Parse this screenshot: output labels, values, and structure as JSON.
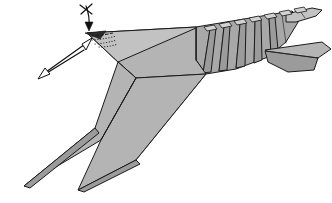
{
  "figure": {
    "background_color": "#ffffff",
    "width": 332,
    "height": 203,
    "caption": ""
  },
  "palette": {
    "paper_front": "#b4b4b4",
    "paper_mid": "#a8a8a8",
    "paper_shade": "#9b9b9b",
    "paper_light": "#c2c2c2",
    "paper_dark": "#2b2b2b",
    "loop_tab": "#d2d2d2",
    "line": "#1a1a1a",
    "arrow": "#111111"
  },
  "parts": {
    "head_tip": "head-tip",
    "head_plate": "head-plate",
    "body_panel": "body-panel",
    "upper_wing": "upper-wing",
    "lower_wing": "lower-wing",
    "wing_underside": "wing-underside",
    "abdomen": "segmented-abdomen",
    "tail_fin_upper": "tail-fin-upper",
    "tail_fin_lower": "tail-fin-lower",
    "antenna_tip": "antenna-tip"
  },
  "segments": {
    "label": "abdomen-segments",
    "count": 6
  },
  "loop_tabs": {
    "label": "spine-tabs",
    "count": 7
  },
  "annotations": {
    "fold_arrow": {
      "name": "valley-fold-arrow",
      "kind": "fold-down-arrow",
      "direction": "down"
    },
    "unfold_marker": {
      "name": "fold-and-unfold-tick",
      "kind": "crossing-tick"
    },
    "pleat_arrow": {
      "name": "pleat-double-arrow",
      "kind": "double-headed-arrow",
      "direction": "up-right"
    },
    "crease_hint_dashed": {
      "name": "dashed-crease-hint"
    },
    "crease_hint_dotted": {
      "name": "dotted-crease-hint"
    }
  }
}
